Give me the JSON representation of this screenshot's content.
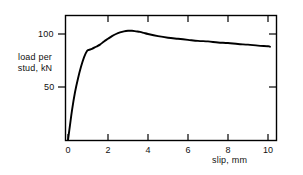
{
  "chart_data": {
    "type": "line",
    "title": "",
    "xlabel": "slip, mm",
    "ylabel": "load per stud, kN",
    "ylabel_lines": [
      "load per",
      "stud, kN"
    ],
    "xlim": [
      0,
      10.6
    ],
    "ylim": [
      0,
      119
    ],
    "xticks": [
      0,
      2,
      4,
      6,
      8,
      10
    ],
    "xtick_labels": [
      "0",
      "2",
      "4",
      "6",
      "8",
      "10"
    ],
    "yticks": [
      50,
      100
    ],
    "ytick_labels": [
      "50",
      "100"
    ],
    "grid": false,
    "legend": null,
    "frame": "box",
    "tick_direction": "in",
    "line_color": "#000000",
    "series": [
      {
        "name": "load-slip curve",
        "x": [
          0.0,
          0.1,
          0.2,
          0.35,
          0.5,
          0.65,
          0.8,
          0.95,
          1.05,
          1.2,
          1.4,
          1.6,
          1.8,
          2.0,
          2.2,
          2.4,
          2.6,
          2.8,
          3.0,
          3.2,
          3.4,
          3.6,
          3.8,
          4.0,
          4.5,
          5.0,
          5.5,
          6.0,
          6.5,
          7.0,
          7.5,
          8.0,
          8.5,
          9.0,
          9.5,
          10.0,
          10.1
        ],
        "y": [
          0,
          14,
          28,
          45,
          58,
          69,
          78,
          84,
          85,
          86,
          88,
          90,
          93,
          95.5,
          98,
          100,
          101.5,
          102.5,
          103,
          103,
          102.5,
          102,
          101,
          100,
          98,
          96.5,
          95.5,
          94.5,
          93.5,
          93,
          92,
          91.5,
          90.5,
          90,
          89,
          88.5,
          88
        ]
      }
    ]
  }
}
